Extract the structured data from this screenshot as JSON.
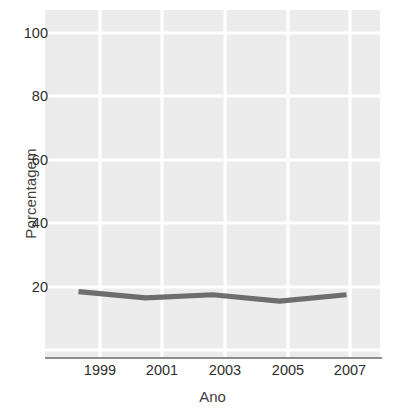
{
  "chart_data": {
    "type": "line",
    "title": "",
    "subtitle": "",
    "xlabel": "Ano",
    "ylabel": "Porcentagem",
    "x": [
      1999,
      2001,
      2003,
      2005,
      2007
    ],
    "xtick_labels": [
      "1999",
      "2001",
      "2003",
      "2005",
      "2007"
    ],
    "ytick_labels": [
      "20",
      "40",
      "60",
      "80",
      "100"
    ],
    "yticks": [
      20,
      40,
      60,
      80,
      100
    ],
    "xlim": [
      1998,
      2008
    ],
    "ylim": [
      0,
      110
    ],
    "grid": true,
    "legend": false,
    "legend_position": "none",
    "series": [
      {
        "name": "Porcentagem",
        "color": "#6d6d6d",
        "values": [
          21,
          19,
          20,
          18,
          20
        ]
      }
    ],
    "annotations": []
  },
  "style": {
    "panel_background": "#ececec",
    "grid_color": "#ffffff",
    "axis_color": "#8c8c8c",
    "tick_label_color": "#2e2e2e",
    "axis_title_color": "#3f3f3f",
    "page_background": "#ffffff"
  }
}
